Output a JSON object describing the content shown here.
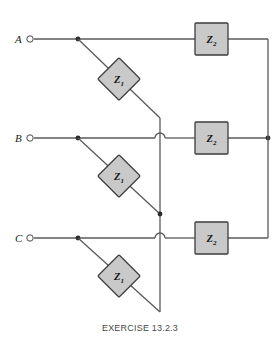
{
  "figure": {
    "caption": "EXERCISE 13.2.3",
    "background_color": "#ffffff",
    "wire_color": "#5a5a5a",
    "component_fill": "#c9c9c9",
    "component_stroke": "#3c3c3c",
    "label_color": "#1a1a1a"
  },
  "terminals": [
    {
      "id": "A",
      "label": "A",
      "y": 39
    },
    {
      "id": "B",
      "label": "B",
      "y": 138
    },
    {
      "id": "C",
      "label": "C",
      "y": 238
    }
  ],
  "components": {
    "series_impedance": {
      "symbol": "Z",
      "subscript": "2",
      "shape": "square",
      "count": 3,
      "instances": [
        {
          "row": "A",
          "x": 211,
          "y": 39
        },
        {
          "row": "B",
          "x": 211,
          "y": 138
        },
        {
          "row": "C",
          "x": 211,
          "y": 238
        }
      ]
    },
    "shunt_impedance": {
      "symbol": "Z",
      "subscript": "1",
      "shape": "diamond",
      "count": 3,
      "instances": [
        {
          "row": "A",
          "x": 119,
          "y": 79
        },
        {
          "row": "B",
          "x": 119,
          "y": 176
        },
        {
          "row": "C",
          "x": 119,
          "y": 276
        }
      ]
    }
  },
  "nodes": {
    "tap_x": 78,
    "center_bus_x": 160,
    "right_bus_x": 268,
    "center_bus_top_y": 118,
    "center_bus_bottom_y": 312,
    "right_bus_top_y": 39,
    "right_bus_bottom_y": 238,
    "terminal_circle_x": 30,
    "wire_start_x": 36,
    "z2_left_x": 195,
    "z2_right_x": 228
  },
  "junction_dots": [
    {
      "name": "tap-A",
      "x": 78,
      "y": 39
    },
    {
      "name": "tap-B",
      "x": 78,
      "y": 138
    },
    {
      "name": "tap-C",
      "x": 78,
      "y": 238
    },
    {
      "name": "bus-B-right",
      "x": 268,
      "y": 138
    },
    {
      "name": "diagonal-B-end",
      "x": 160,
      "y": 214
    }
  ],
  "crossovers": [
    {
      "name": "hop-B",
      "x": 160,
      "y": 138
    },
    {
      "name": "hop-C",
      "x": 160,
      "y": 238
    }
  ]
}
